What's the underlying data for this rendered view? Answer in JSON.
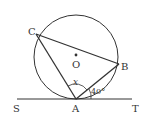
{
  "figure": {
    "points": {
      "C": {
        "label": "C"
      },
      "B": {
        "label": "B"
      },
      "O": {
        "label": "O"
      },
      "A": {
        "label": "A"
      },
      "S": {
        "label": "S"
      },
      "T": {
        "label": "T"
      }
    },
    "angles": {
      "x": {
        "label": "x",
        "at": "A",
        "between": "AC and AB"
      },
      "angle_BAT": {
        "label": "40°",
        "at": "A",
        "between": "AB and AT"
      }
    },
    "colors": {
      "stroke": "#333333",
      "background": "#ffffff"
    }
  }
}
